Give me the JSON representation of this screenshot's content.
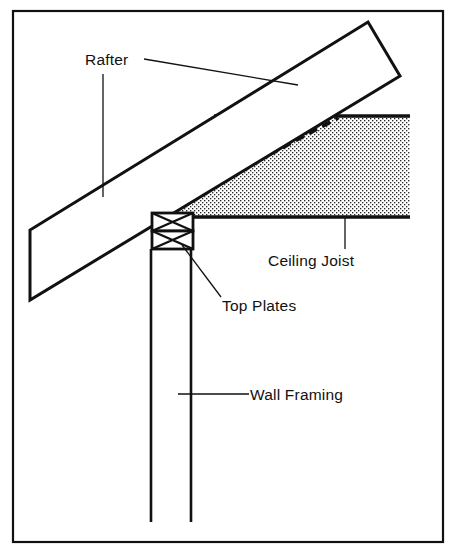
{
  "figure": {
    "kind": "architectural-section-diagram",
    "background_color": "#ffffff",
    "ink_color": "#111111",
    "fill_color_hatch": "#b9b9b9",
    "border": {
      "name": "figure-border",
      "x": 13,
      "y": 11,
      "width": 430,
      "height": 531,
      "stroke_width": 2.2
    }
  },
  "labels": {
    "rafter": {
      "text": "Rafter",
      "x": 85,
      "y": 65
    },
    "ceiling_joist": {
      "text": "Ceiling Joist",
      "x": 268,
      "y": 266
    },
    "top_plates": {
      "text": "Top Plates",
      "x": 222,
      "y": 311
    },
    "wall_framing": {
      "text": "Wall Framing",
      "x": 250,
      "y": 400
    }
  },
  "leaders": {
    "rafter_vertical": {
      "x1": 103,
      "y1": 74,
      "x2": 103,
      "y2": 197
    },
    "rafter_diagonal": {
      "x1": 144,
      "y1": 59,
      "x2": 298,
      "y2": 85
    },
    "ceiling_joist_vertical": {
      "x1": 345,
      "y1": 218,
      "x2": 345,
      "y2": 248
    },
    "top_plates_diagonal": {
      "x1": 182,
      "y1": 245,
      "x2": 221,
      "y2": 297
    },
    "wall_framing_horizontal": {
      "x1": 178,
      "y1": 394,
      "x2": 249,
      "y2": 394
    }
  },
  "geometry": {
    "rafter_board": {
      "name": "rafter-board",
      "points": "30,230 30,300 400,76 368,22",
      "note": "sloped rafter shown as a long parallelogram board with plumb-cut left end"
    },
    "ceiling_joist_body": {
      "name": "ceiling-joist-body",
      "points": "152,196 214,116 410,116 410,217 152,217",
      "note": "stippled joist with its upper-left corner bevelled along the rafter slope"
    },
    "ceiling_joist_dashed_line": {
      "name": "ceiling-joist-dashed-line",
      "x1": 190,
      "y1": 197,
      "x2": 338,
      "y2": 118,
      "dash": "9 6"
    },
    "top_plate_upper": {
      "x": 152,
      "y": 213,
      "width": 41,
      "height": 18
    },
    "top_plate_lower": {
      "x": 152,
      "y": 231,
      "width": 41,
      "height": 18
    },
    "wall_stud_left": {
      "x1": 151,
      "y1": 249,
      "x2": 151,
      "y2": 522
    },
    "wall_stud_right": {
      "x1": 191,
      "y1": 249,
      "x2": 191,
      "y2": 522
    }
  }
}
